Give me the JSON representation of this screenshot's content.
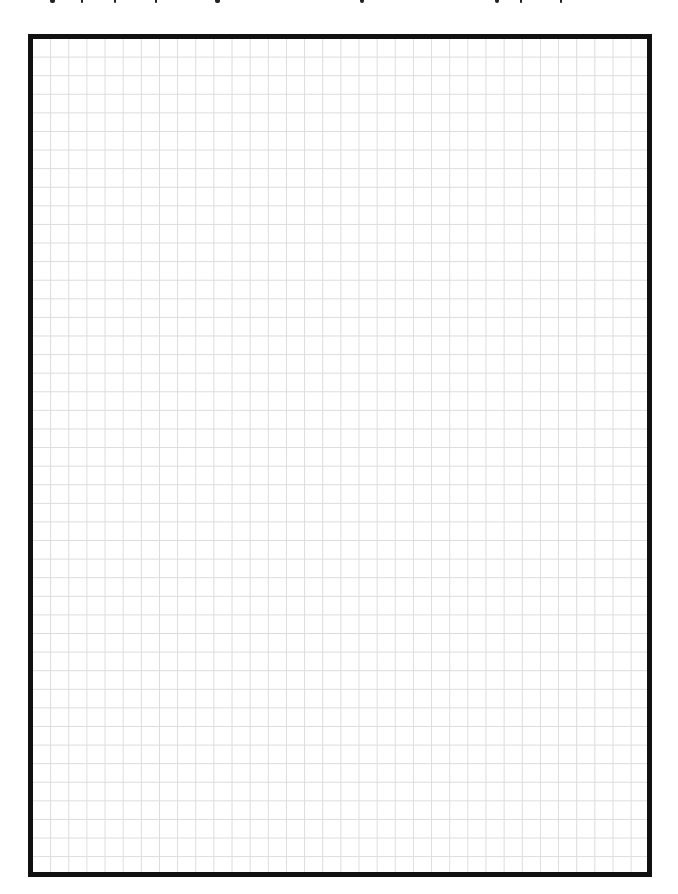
{
  "page": {
    "type": "graph-paper",
    "background_color": "#ffffff",
    "border_color": "#111111",
    "grid_line_color": "#dcdcdc",
    "grid": {
      "cell_width_px": 18.15,
      "cell_height_px": 18.6,
      "columns": 34,
      "rows": 45
    },
    "top_text_cutoff": true
  }
}
